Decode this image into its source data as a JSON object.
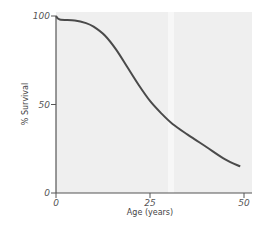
{
  "chart_data": {
    "type": "line",
    "title": "",
    "xlabel": "Age (years)",
    "ylabel": "% Survival",
    "xlim": [
      0,
      50
    ],
    "ylim": [
      0,
      100
    ],
    "xticks": [
      "0",
      "25",
      "50"
    ],
    "yticks": [
      "0",
      "50",
      "100"
    ],
    "grid": false,
    "legend": null,
    "series": [
      {
        "name": "Survival",
        "x": [
          0,
          1,
          5,
          8,
          10,
          13,
          16,
          19,
          22,
          25,
          28,
          31,
          35,
          40,
          45,
          49
        ],
        "y": [
          100,
          98,
          97.5,
          96,
          94,
          89,
          81,
          71,
          61,
          52,
          45,
          39,
          33,
          26,
          19,
          15
        ]
      }
    ],
    "colors": {
      "line": "#4a4a4a",
      "plot_bg": "#eeeeee",
      "axis": "#555555"
    }
  }
}
